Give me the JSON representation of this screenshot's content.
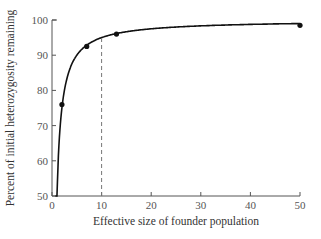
{
  "chart_data": {
    "type": "line",
    "title": "",
    "xlabel": "Effective size of founder population",
    "ylabel": "Percent of initial heterozygosity remaining",
    "xlim": [
      0,
      50
    ],
    "ylim": [
      50,
      100
    ],
    "x_ticks": [
      0,
      10,
      20,
      30,
      40,
      50
    ],
    "y_ticks": [
      50,
      60,
      70,
      80,
      90,
      100
    ],
    "grid": false,
    "legend": null,
    "series": [
      {
        "name": "Heterozygosity remaining (curve: 100*(1-1/(2N)))",
        "x": [
          0.5,
          1,
          2,
          3,
          4,
          5,
          7,
          10,
          13,
          20,
          30,
          40,
          50
        ],
        "y": [
          50,
          50,
          75,
          83.3,
          87.5,
          90,
          92.9,
          95,
          96.2,
          97.5,
          98.3,
          98.75,
          99
        ]
      }
    ],
    "marked_points": {
      "x": [
        2,
        7,
        13,
        50
      ],
      "y": [
        76,
        92.5,
        96,
        98.5
      ]
    },
    "annotations": [
      {
        "type": "dashed-vertical-line",
        "x": 10,
        "from_y": 50,
        "to_y": 95
      }
    ]
  }
}
